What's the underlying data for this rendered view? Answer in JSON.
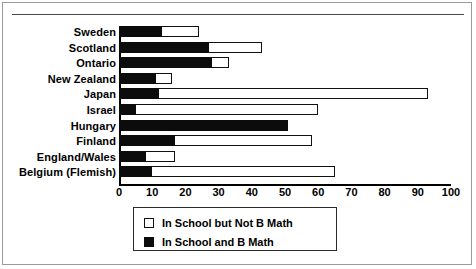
{
  "chart_data": {
    "type": "bar",
    "orientation": "horizontal",
    "stacked": true,
    "title": "",
    "xlabel": "",
    "ylabel": "",
    "xlim": [
      0,
      100
    ],
    "xticks": [
      0,
      10,
      20,
      30,
      40,
      50,
      60,
      70,
      80,
      90,
      100
    ],
    "grid": false,
    "legend_position": "bottom-left",
    "categories": [
      "Sweden",
      "Scotland",
      "Ontario",
      "New Zealand",
      "Japan",
      "Israel",
      "Hungary",
      "Finland",
      "England/Wales",
      "Belgium (Flemish)"
    ],
    "series": [
      {
        "name": "In School and B Math",
        "key": "in_school_and_b_math",
        "color": "#0c0c0c",
        "swatch": "filled",
        "values": [
          13,
          27,
          28,
          11,
          12,
          5,
          51,
          17,
          8,
          10
        ]
      },
      {
        "name": "In School but Not B Math",
        "key": "in_school_but_not_b_math",
        "color": "#ffffff",
        "swatch": "open",
        "values": [
          11,
          16,
          5,
          5,
          81,
          55,
          0,
          41,
          9,
          55
        ]
      }
    ],
    "totals": [
      24,
      43,
      33,
      16,
      93,
      60,
      51,
      58,
      17,
      65
    ]
  },
  "legend": {
    "items": [
      {
        "label": "In School but Not B Math",
        "swatch": "open"
      },
      {
        "label": "In School and B Math",
        "swatch": "filled"
      }
    ]
  }
}
